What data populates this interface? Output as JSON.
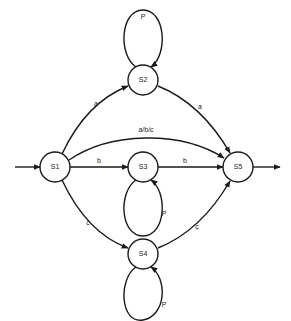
{
  "diagram": {
    "type": "state-transition-diagram",
    "nodes": [
      {
        "id": "S1",
        "label": "S1",
        "cx": 55,
        "cy": 167
      },
      {
        "id": "S2",
        "label": "S2",
        "cx": 143,
        "cy": 80
      },
      {
        "id": "S3",
        "label": "S3",
        "cx": 143,
        "cy": 167
      },
      {
        "id": "S4",
        "label": "S4",
        "cx": 143,
        "cy": 254
      },
      {
        "id": "S5",
        "label": "S5",
        "cx": 238,
        "cy": 167
      }
    ],
    "edges": [
      {
        "from": "start",
        "to": "S1",
        "label": ""
      },
      {
        "from": "S1",
        "to": "S2",
        "label": "a"
      },
      {
        "from": "S2",
        "to": "S5",
        "label": "a"
      },
      {
        "from": "S1",
        "to": "S5",
        "label": "a/b/c"
      },
      {
        "from": "S1",
        "to": "S3",
        "label": "b"
      },
      {
        "from": "S3",
        "to": "S5",
        "label": "b"
      },
      {
        "from": "S1",
        "to": "S4",
        "label": "c"
      },
      {
        "from": "S4",
        "to": "S5",
        "label": "c"
      },
      {
        "from": "S2",
        "to": "S2",
        "label": "P"
      },
      {
        "from": "S3",
        "to": "S3",
        "label": "P"
      },
      {
        "from": "S4",
        "to": "S4",
        "label": "P"
      },
      {
        "from": "S5",
        "to": "end",
        "label": ""
      }
    ],
    "labels": {
      "s1_s2": "a",
      "s2_s5": "a",
      "s1_s5": "a/b/c",
      "s1_s3": "b",
      "s3_s5": "b",
      "s1_s4": "c",
      "s4_s5": "c",
      "loop_s2": "P",
      "loop_s3": "P",
      "loop_s4": "P"
    },
    "colors": {
      "stroke": "#1a1a1a",
      "background": "#ffffff"
    }
  }
}
